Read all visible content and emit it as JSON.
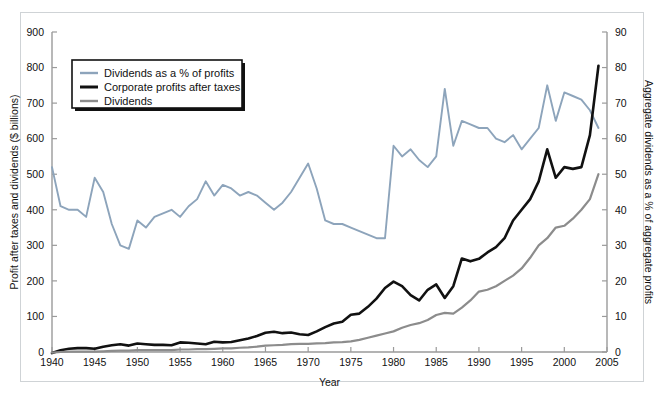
{
  "figure": {
    "background": "#ffffff",
    "border_color": "#cfd3d6"
  },
  "chart_data": {
    "type": "line",
    "title": "",
    "xlabel": "Year",
    "ylabel": "Profit after taxes and dividends ($ billions)",
    "y2label": "Aggregate dividends as a % of aggregate profits",
    "xlim": [
      1940,
      2005
    ],
    "ylim": [
      0,
      900
    ],
    "y2lim": [
      0,
      90
    ],
    "grid": false,
    "legend_position": "upper-left",
    "xticks": [
      1940,
      1945,
      1950,
      1955,
      1960,
      1965,
      1970,
      1975,
      1980,
      1985,
      1990,
      1995,
      2000,
      2005
    ],
    "yticks": [
      0,
      100,
      200,
      300,
      400,
      500,
      600,
      700,
      800,
      900
    ],
    "y2ticks": [
      0,
      10,
      20,
      30,
      40,
      50,
      60,
      70,
      80,
      90
    ],
    "x": [
      1940,
      1941,
      1942,
      1943,
      1944,
      1945,
      1946,
      1947,
      1948,
      1949,
      1950,
      1951,
      1952,
      1953,
      1954,
      1955,
      1956,
      1957,
      1958,
      1959,
      1960,
      1961,
      1962,
      1963,
      1964,
      1965,
      1966,
      1967,
      1968,
      1969,
      1970,
      1971,
      1972,
      1973,
      1974,
      1975,
      1976,
      1977,
      1978,
      1979,
      1980,
      1981,
      1982,
      1983,
      1984,
      1985,
      1986,
      1987,
      1988,
      1989,
      1990,
      1991,
      1992,
      1993,
      1994,
      1995,
      1996,
      1997,
      1998,
      1999,
      2000,
      2001,
      2002,
      2003,
      2004
    ],
    "series": [
      {
        "name": "Dividends as a % of profits",
        "axis": "right",
        "color": "#8da4bb",
        "unit": "%",
        "values": [
          52,
          41,
          40,
          40,
          38,
          49,
          45,
          36,
          30,
          29,
          37,
          35,
          38,
          39,
          40,
          38,
          41,
          43,
          48,
          44,
          47,
          46,
          44,
          45,
          44,
          42,
          40,
          42,
          45,
          49,
          53,
          46,
          37,
          36,
          36,
          35,
          34,
          33,
          32,
          32,
          58,
          55,
          57,
          54,
          52,
          55,
          74,
          58,
          65,
          64,
          63,
          63,
          60,
          59,
          61,
          57,
          60,
          63,
          75,
          65,
          73,
          72,
          71,
          68,
          63
        ]
      },
      {
        "name": "Corporate profits after taxes",
        "axis": "left",
        "color": "#111111",
        "unit": "$ billions",
        "values": [
          -3,
          5,
          9,
          11,
          11,
          9,
          15,
          19,
          22,
          18,
          24,
          22,
          20,
          20,
          19,
          27,
          26,
          24,
          22,
          29,
          27,
          28,
          33,
          38,
          45,
          54,
          57,
          53,
          55,
          50,
          48,
          58,
          70,
          80,
          85,
          105,
          108,
          127,
          150,
          180,
          198,
          185,
          160,
          145,
          175,
          190,
          152,
          185,
          263,
          255,
          262,
          280,
          295,
          320,
          370,
          400,
          430,
          480,
          570,
          490,
          520,
          515,
          520,
          610,
          805
        ]
      },
      {
        "name": "Dividends",
        "axis": "left",
        "color": "#8c8c8c",
        "unit": "$ billions",
        "values": [
          -2,
          0,
          1,
          1,
          1,
          1,
          2,
          3,
          4,
          4,
          5,
          5,
          5,
          5,
          5,
          7,
          7,
          8,
          8,
          9,
          10,
          10,
          12,
          13,
          15,
          18,
          19,
          20,
          22,
          23,
          23,
          24,
          25,
          27,
          28,
          30,
          34,
          40,
          46,
          52,
          58,
          68,
          76,
          81,
          90,
          104,
          110,
          108,
          125,
          145,
          170,
          175,
          185,
          200,
          215,
          235,
          265,
          300,
          320,
          350,
          355,
          375,
          400,
          430,
          500
        ]
      }
    ]
  },
  "legend": {
    "items": [
      {
        "label": "Dividends as a % of profits",
        "color": "#8da4bb"
      },
      {
        "label": "Corporate profits after taxes",
        "color": "#111111"
      },
      {
        "label": "Dividends",
        "color": "#8c8c8c"
      }
    ]
  },
  "axes": {
    "x_title": "Year",
    "y_left_title": "Profit after taxes and dividends ($ billions)",
    "y_right_title": "Aggregate dividends as a % of aggregate profits"
  }
}
